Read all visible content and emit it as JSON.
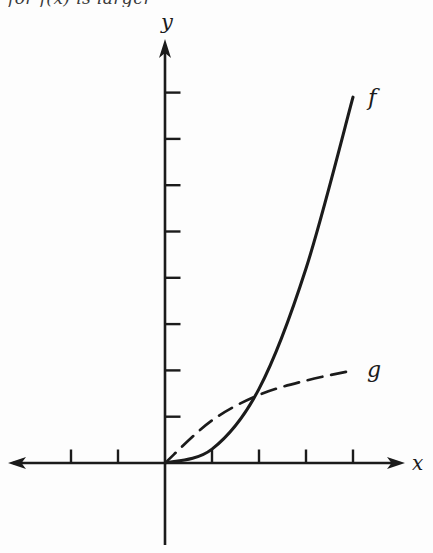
{
  "clipped_top_text": "for f(x) is larger",
  "figure": {
    "y_axis_label": "y",
    "x_axis_label": "x",
    "curve_f_label": "f",
    "curve_g_label": "g"
  },
  "colors": {
    "ink": "#1b1b1b",
    "background": "#fdfdfd"
  },
  "chart_data": {
    "type": "line",
    "title": "",
    "xlabel": "x",
    "ylabel": "y",
    "x": [
      0,
      1,
      2,
      3,
      4
    ],
    "series": [
      {
        "name": "f",
        "line_style": "solid",
        "values": [
          0,
          0.3,
          1.6,
          4.2,
          7.9
        ]
      },
      {
        "name": "g",
        "line_style": "dashed",
        "values": [
          0,
          0.92,
          1.47,
          1.78,
          2.0
        ]
      }
    ],
    "x_ticks": [
      -2,
      -1,
      1,
      2,
      3,
      4
    ],
    "y_ticks": [
      1,
      2,
      3,
      4,
      5,
      6,
      7,
      8
    ],
    "tick_labels_shown": false,
    "axis_range": {
      "x": [
        -3.3,
        5.1
      ],
      "y": [
        -1.8,
        9.1
      ]
    },
    "grid": false,
    "legend_position": "curve-end-labels",
    "intersection_approx": {
      "x": 1.7,
      "y": 1.35
    }
  }
}
